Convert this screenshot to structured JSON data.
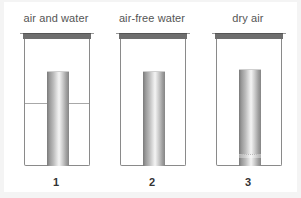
{
  "figure": {
    "setups": [
      {
        "number": "1",
        "label": "air and water",
        "has_water_line": true,
        "has_drying_band": false
      },
      {
        "number": "2",
        "label": "air-free water",
        "has_water_line": false,
        "has_drying_band": false
      },
      {
        "number": "3",
        "label": "dry air",
        "has_water_line": false,
        "has_drying_band": true
      }
    ]
  },
  "colors": {
    "lid": "#6e6e6e",
    "jar_outline": "#8a8a8a",
    "label_text": "#555555",
    "number_text": "#333333",
    "background": "#ffffff"
  }
}
